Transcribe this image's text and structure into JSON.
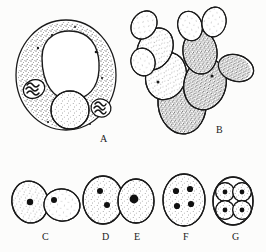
{
  "figure": {
    "title": "Yeast cell morphology and nuclear division stages",
    "background_color": "#fcfcfb",
    "ink_color": "#1a1a1a",
    "width": 266,
    "height": 252,
    "style": "stippled pen-and-ink biological line drawing"
  },
  "panels": [
    {
      "id": "A",
      "label": "A",
      "label_x": 100,
      "label_y": 140,
      "name": "single-yeast-cell-with-organelles",
      "description": "Large single ovoid yeast cell in cross-section showing cell wall, granular stippled cytoplasm, a large clear vacuole, a stippled nucleus and two dark volutin granules",
      "organelles": [
        {
          "name": "cell-wall",
          "count": 1
        },
        {
          "name": "vacuole",
          "count": 1
        },
        {
          "name": "nucleus",
          "count": 1
        },
        {
          "name": "volutin-granule",
          "count": 2
        }
      ]
    },
    {
      "id": "B",
      "label": "B",
      "label_x": 216,
      "label_y": 131,
      "name": "budding-cell-chain-pseudohyphae",
      "description": "Branched chain of budding yeast cells forming a pseudohypha with small terminal buds",
      "cell_count": 10
    },
    {
      "id": "C",
      "label": "C",
      "label_x": 42,
      "label_y": 238,
      "name": "budding-pair-two-nuclei",
      "description": "Two attached daughter cells, each containing a single dark nucleus",
      "cell_count": 2,
      "nuclei_per_cell": 1
    },
    {
      "id": "D",
      "label": "D",
      "label_x": 103,
      "label_y": 238,
      "name": "cell-with-two-nuclei",
      "description": "Single ovoid cell containing two dark nuclei after division",
      "cell_count": 1,
      "nuclei_per_cell": 2
    },
    {
      "id": "E",
      "label": "E",
      "label_x": 135,
      "label_y": 238,
      "name": "cell-with-single-large-nucleus",
      "description": "Single ovoid cell containing one large dark nucleus",
      "cell_count": 1,
      "nuclei_per_cell": 1
    },
    {
      "id": "F",
      "label": "F",
      "label_x": 184,
      "label_y": 238,
      "name": "cell-with-four-nuclei",
      "description": "Single ovoid cell containing four dark nuclei arranged in a quadrangle",
      "cell_count": 1,
      "nuclei_per_cell": 4
    },
    {
      "id": "G",
      "label": "G",
      "label_x": 233,
      "label_y": 238,
      "name": "ascus-with-four-ascospores",
      "description": "Ascus containing four rounded ascospores, each with a dark central body",
      "cell_count": 1,
      "ascospores": 4
    }
  ]
}
